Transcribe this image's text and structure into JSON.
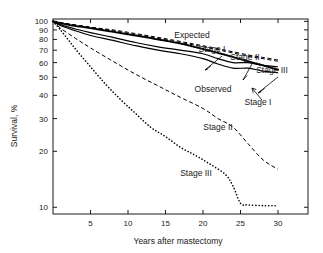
{
  "figure": {
    "background": "#ffffff",
    "ink": "#1a1a1a"
  },
  "axes": {
    "ylabel": "Survival, %",
    "xlabel": "Years after mastectomy",
    "yticks": [
      100,
      90,
      80,
      70,
      60,
      50,
      40,
      30,
      20,
      10
    ],
    "ytick_labels": [
      "100",
      "90",
      "80",
      "70",
      "60",
      "50",
      "40",
      "30",
      "20",
      "10"
    ],
    "xticks": [
      5,
      10,
      15,
      20,
      25,
      30
    ],
    "xtick_labels": [
      "5",
      "10",
      "15",
      "20",
      "25",
      "30"
    ],
    "yscale": "log",
    "ylim": [
      9.2,
      103
    ],
    "xlim": [
      0,
      34
    ],
    "grid": false,
    "frame": "box"
  },
  "annotations": [
    {
      "key": "expected",
      "text": "Expected",
      "x": 192,
      "y": 38
    },
    {
      "key": "stage1_up",
      "text": "Stage I",
      "x": 212,
      "y": 52
    },
    {
      "key": "stage2_up",
      "text": "Stage II",
      "x": 245,
      "y": 60
    },
    {
      "key": "stage3_up",
      "text": "Stage III",
      "x": 272,
      "y": 73
    },
    {
      "key": "observed",
      "text": "Observed",
      "x": 213,
      "y": 92
    },
    {
      "key": "stage1_lo",
      "text": "Stage I",
      "x": 258,
      "y": 105
    },
    {
      "key": "stage2_lo",
      "text": "Stage II",
      "x": 218,
      "y": 130
    },
    {
      "key": "stage3_lo",
      "text": "Stage III",
      "x": 196,
      "y": 176
    }
  ],
  "chart_data": {
    "type": "line",
    "title": "",
    "xlabel": "Years after mastectomy",
    "ylabel": "Survival, %",
    "yscale": "log",
    "ylim": [
      9.2,
      103
    ],
    "xlim": [
      0,
      34
    ],
    "legend_position": "inline-annotations",
    "grid": false,
    "series": [
      {
        "name": "Expected",
        "style": "dashed",
        "width": 1.0,
        "x": [
          0,
          2,
          5,
          8,
          11,
          14,
          17,
          20,
          23,
          26,
          28,
          30
        ],
        "y": [
          100,
          97,
          93,
          89,
          85,
          81,
          77,
          73,
          69,
          65,
          63,
          61
        ]
      },
      {
        "name": "Stage I (expected-adjacent, thick dotted)",
        "style": "thick-dotted",
        "width": 2.0,
        "x": [
          0,
          2,
          5,
          8,
          11,
          14,
          17,
          20,
          23,
          26,
          28,
          30
        ],
        "y": [
          100,
          96,
          92,
          88,
          84,
          80,
          76,
          71,
          66,
          61,
          58,
          55
        ]
      },
      {
        "name": "Stage II (upper dashed)",
        "style": "dashed",
        "width": 1.0,
        "x": [
          0,
          2,
          5,
          8,
          11,
          14,
          17,
          20,
          23,
          26,
          28,
          30
        ],
        "y": [
          100,
          97,
          93,
          90,
          86,
          82,
          78,
          74,
          70,
          66,
          64,
          62
        ]
      },
      {
        "name": "Observed",
        "style": "solid",
        "width": 1.2,
        "x": [
          0,
          1,
          3,
          5,
          8,
          11,
          14,
          17,
          20,
          22,
          24,
          26,
          28,
          30
        ],
        "y": [
          100,
          96,
          91,
          87,
          82,
          77,
          73,
          70,
          67,
          63,
          60,
          60,
          58,
          57
        ]
      },
      {
        "name": "Stage I (observed, solid)",
        "style": "solid",
        "width": 1.2,
        "x": [
          0,
          1,
          3,
          5,
          8,
          11,
          14,
          17,
          20,
          22,
          24,
          26,
          28,
          30
        ],
        "y": [
          100,
          95,
          89,
          84,
          79,
          74,
          70,
          67,
          63,
          59,
          56,
          56,
          54,
          53
        ]
      },
      {
        "name": "Stage II (observed, dashed)",
        "style": "dashed",
        "width": 1.0,
        "x": [
          0,
          1,
          3,
          5,
          8,
          11,
          14,
          17,
          20,
          22,
          24,
          26,
          28,
          30
        ],
        "y": [
          100,
          92,
          81,
          72,
          61,
          52,
          45,
          39,
          34,
          30,
          27,
          22,
          18,
          16
        ]
      },
      {
        "name": "Stage III (observed, dotted)",
        "style": "dotted",
        "width": 1.6,
        "x": [
          0,
          1,
          2,
          3,
          5,
          7,
          9,
          11,
          13,
          15,
          17,
          19,
          21,
          23,
          24,
          25,
          26,
          28,
          30
        ],
        "y": [
          100,
          90,
          80,
          71,
          57,
          46,
          38,
          32,
          27,
          24,
          21,
          19,
          17,
          15,
          13,
          10.5,
          10.3,
          10.2,
          10.2
        ]
      }
    ]
  }
}
